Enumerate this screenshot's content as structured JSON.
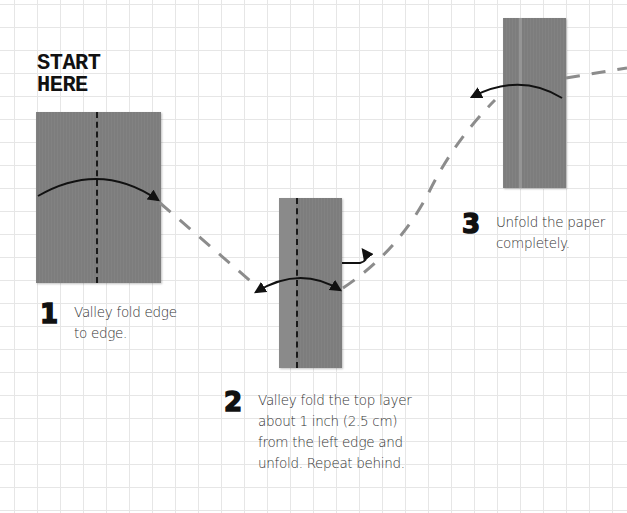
{
  "header": {
    "start_label_line1": "START",
    "start_label_line2": "HERE"
  },
  "steps": [
    {
      "number": "1",
      "text_lines": [
        "Valley fold edge",
        "to edge."
      ]
    },
    {
      "number": "2",
      "text_lines": [
        "Valley fold the top layer",
        "about 1 inch (2.5 cm)",
        "from the left edge and",
        "unfold. Repeat behind."
      ]
    },
    {
      "number": "3",
      "text_lines": [
        "Unfold the paper",
        "completely."
      ]
    }
  ],
  "colors": {
    "paper": "#7d7d7d",
    "grid": "#e6e6e6",
    "connector": "#8c8c8c",
    "arrow": "#111111"
  },
  "icons": {
    "valley-fold-arrow": "curved-arrow",
    "unfold-arrow": "double-headed-curved-arrow",
    "repeat-behind-arrow": "mountain-return-arrow",
    "step-connector": "dashed-path"
  }
}
